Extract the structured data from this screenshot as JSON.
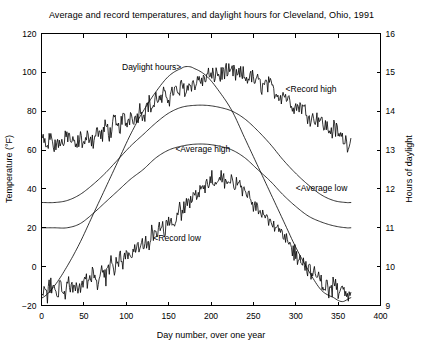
{
  "chart_data": {
    "type": "line",
    "title": "Average and record temperatures, and daylight hours for Cleveland, Ohio, 1991",
    "xlabel": "Day number, over one year",
    "ylabel": "Temperature (°F)",
    "y2label": "Hours of daylight",
    "xlim": [
      0,
      400
    ],
    "ylim": [
      -20,
      120
    ],
    "y2lim": [
      9,
      16
    ],
    "xticks": [
      0,
      50,
      100,
      150,
      200,
      250,
      300,
      350,
      400
    ],
    "yticks": [
      -20,
      0,
      20,
      40,
      60,
      80,
      100,
      120
    ],
    "y2ticks": [
      9,
      10,
      11,
      12,
      13,
      14,
      15,
      16
    ],
    "grid": false,
    "legend_position": "inline-annotations",
    "annotations": [
      {
        "text": "Daylight hours>",
        "x": 95,
        "y": 101,
        "anchor": "start"
      },
      {
        "text": "<Record high",
        "x": 288,
        "y": 90,
        "anchor": "start"
      },
      {
        "text": "<Average high",
        "x": 158,
        "y": 59,
        "anchor": "start"
      },
      {
        "text": "<Average low",
        "x": 300,
        "y": 39,
        "anchor": "start"
      },
      {
        "text": "<Record low",
        "x": 132,
        "y": 13,
        "anchor": "start"
      }
    ],
    "series": [
      {
        "name": "Record high",
        "axis": "left",
        "units": "degF",
        "noisy": true,
        "x": [
          1,
          6,
          11,
          16,
          21,
          26,
          31,
          36,
          41,
          46,
          51,
          56,
          61,
          66,
          71,
          76,
          81,
          86,
          91,
          96,
          101,
          106,
          111,
          116,
          121,
          126,
          131,
          136,
          141,
          146,
          151,
          156,
          161,
          166,
          171,
          176,
          181,
          186,
          191,
          196,
          201,
          206,
          211,
          216,
          221,
          226,
          231,
          236,
          241,
          246,
          251,
          256,
          261,
          266,
          271,
          276,
          281,
          286,
          291,
          296,
          301,
          306,
          311,
          316,
          321,
          326,
          331,
          336,
          341,
          346,
          351,
          356,
          361,
          365
        ],
        "values": [
          66,
          62,
          67,
          61,
          65,
          63,
          68,
          64,
          62,
          66,
          63,
          68,
          65,
          70,
          67,
          72,
          69,
          74,
          71,
          76,
          74,
          79,
          76,
          81,
          79,
          84,
          82,
          87,
          85,
          89,
          87,
          91,
          89,
          93,
          91,
          95,
          93,
          97,
          95,
          99,
          97,
          100,
          98,
          101,
          99,
          100,
          98,
          99,
          97,
          98,
          96,
          95,
          93,
          94,
          92,
          90,
          88,
          89,
          86,
          84,
          82,
          83,
          80,
          78,
          76,
          77,
          74,
          72,
          70,
          71,
          68,
          66,
          64,
          65
        ]
      },
      {
        "name": "Average high",
        "axis": "left",
        "units": "degF",
        "noisy": false,
        "x": [
          1,
          15,
          30,
          45,
          60,
          75,
          90,
          105,
          120,
          135,
          150,
          165,
          180,
          195,
          210,
          225,
          240,
          255,
          270,
          285,
          300,
          315,
          330,
          345,
          360,
          365
        ],
        "values": [
          33,
          33,
          34,
          37,
          42,
          48,
          55,
          62,
          68,
          74,
          79,
          82,
          83,
          83,
          82,
          80,
          76,
          70,
          63,
          55,
          48,
          42,
          37,
          34,
          33,
          33
        ]
      },
      {
        "name": "Average low",
        "axis": "left",
        "units": "degF",
        "noisy": false,
        "x": [
          1,
          15,
          30,
          45,
          60,
          75,
          90,
          105,
          120,
          135,
          150,
          165,
          180,
          195,
          210,
          225,
          240,
          255,
          270,
          285,
          300,
          315,
          330,
          345,
          360,
          365
        ],
        "values": [
          20,
          20,
          20,
          22,
          27,
          33,
          39,
          45,
          50,
          56,
          60,
          62,
          63,
          63,
          62,
          60,
          56,
          50,
          44,
          37,
          31,
          26,
          23,
          21,
          20,
          20
        ]
      },
      {
        "name": "Record low",
        "axis": "left",
        "units": "degF",
        "noisy": true,
        "x": [
          1,
          6,
          11,
          16,
          21,
          26,
          31,
          36,
          41,
          46,
          51,
          56,
          61,
          66,
          71,
          76,
          81,
          86,
          91,
          96,
          101,
          106,
          111,
          116,
          121,
          126,
          131,
          136,
          141,
          146,
          151,
          156,
          161,
          166,
          171,
          176,
          181,
          186,
          191,
          196,
          201,
          206,
          211,
          216,
          221,
          226,
          231,
          236,
          241,
          246,
          251,
          256,
          261,
          266,
          271,
          276,
          281,
          286,
          291,
          296,
          301,
          306,
          311,
          316,
          321,
          326,
          331,
          336,
          341,
          346,
          351,
          356,
          361,
          365
        ],
        "values": [
          -12,
          -16,
          -9,
          -14,
          -10,
          -15,
          -8,
          -13,
          -7,
          -11,
          -6,
          -9,
          -4,
          -7,
          -2,
          -5,
          1,
          -2,
          4,
          1,
          7,
          4,
          10,
          7,
          14,
          11,
          18,
          15,
          22,
          19,
          26,
          23,
          30,
          27,
          34,
          32,
          38,
          36,
          42,
          40,
          45,
          43,
          46,
          44,
          45,
          43,
          42,
          40,
          38,
          36,
          33,
          31,
          28,
          26,
          23,
          20,
          17,
          15,
          12,
          9,
          6,
          4,
          1,
          -2,
          -4,
          -6,
          -8,
          -10,
          -12,
          -9,
          -14,
          -11,
          -15,
          -13
        ]
      },
      {
        "name": "Daylight hours",
        "axis": "right",
        "units": "hours",
        "noisy": false,
        "x": [
          1,
          15,
          30,
          45,
          60,
          75,
          90,
          105,
          120,
          135,
          150,
          165,
          172,
          180,
          195,
          210,
          225,
          240,
          255,
          270,
          285,
          300,
          315,
          330,
          345,
          355,
          365
        ],
        "values": [
          9.2,
          9.5,
          10.0,
          10.6,
          11.3,
          12.0,
          12.7,
          13.4,
          14.0,
          14.5,
          14.9,
          15.1,
          15.15,
          15.1,
          14.9,
          14.5,
          14.0,
          13.3,
          12.6,
          11.9,
          11.2,
          10.5,
          9.9,
          9.4,
          9.2,
          9.1,
          9.2
        ]
      }
    ]
  }
}
